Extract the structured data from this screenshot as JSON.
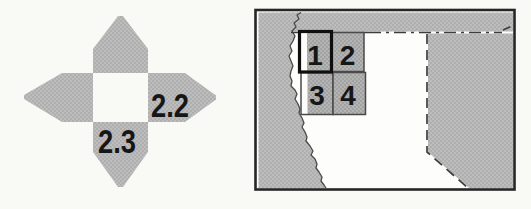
{
  "colors": {
    "paper": "#f9f9f6",
    "map_interior": "#fdfdfb",
    "halftone_gray": "#bdbdbd",
    "halftone_dot": "#a8a8a8",
    "cell_gray": "#b4b4b4",
    "cell_dot": "#9a9a9a",
    "frame": "#262626",
    "border_line": "#3d3d3d",
    "coastline": "#4a4a4a",
    "ink": "#161616"
  },
  "index_diagram": {
    "right_arm_label": "2.2",
    "bottom_arm_label": "2.3"
  },
  "map": {
    "grid_cells": [
      {
        "label": "1",
        "highlighted": true
      },
      {
        "label": "2",
        "highlighted": false
      },
      {
        "label": "3",
        "highlighted": false
      },
      {
        "label": "4",
        "highlighted": false
      }
    ]
  }
}
